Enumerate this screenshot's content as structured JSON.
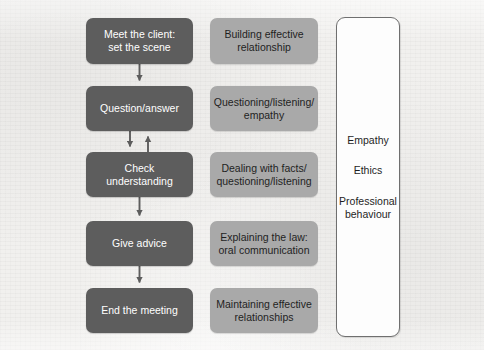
{
  "diagram": {
    "background_color": "#f1f0ee",
    "columns": {
      "process": {
        "name": "Interview stages",
        "box_color": "#5d5d5d",
        "text_color": "#ffffff",
        "steps": [
          {
            "id": "meet-the-client",
            "line1": "Meet the client:",
            "line2": "set the scene"
          },
          {
            "id": "question-answer",
            "line1": "Question/answer",
            "line2": ""
          },
          {
            "id": "check-understanding",
            "line1": "Check",
            "line2": "understanding"
          },
          {
            "id": "give-advice",
            "line1": "Give advice",
            "line2": ""
          },
          {
            "id": "end-the-meeting",
            "line1": "End the meeting",
            "line2": ""
          }
        ]
      },
      "skills": {
        "name": "Associated skills",
        "box_color": "#a9a9a9",
        "text_color": "#1f1f1f",
        "items": [
          {
            "id": "building-effective-relationship",
            "line1": "Building effective",
            "line2": "relationship"
          },
          {
            "id": "questioning-listening-empathy",
            "line1": "Questioning/listening/",
            "line2": "empathy"
          },
          {
            "id": "dealing-with-facts",
            "line1": "Dealing with facts/",
            "line2": "questioning/listening"
          },
          {
            "id": "explaining-the-law",
            "line1": "Explaining the law:",
            "line2": "oral communication"
          },
          {
            "id": "maintaining-effective-relationships",
            "line1": "Maintaining effective",
            "line2": "relationships"
          }
        ]
      },
      "values": {
        "name": "Overarching qualities",
        "box_color": "#fdfdfd",
        "border_color": "#6f6f6f",
        "text_color": "#1f1f1f",
        "items": [
          {
            "id": "empathy",
            "line1": "Empathy",
            "line2": ""
          },
          {
            "id": "ethics",
            "line1": "Ethics",
            "line2": ""
          },
          {
            "id": "professional-behaviour",
            "line1": "Professional",
            "line2": "behaviour"
          }
        ]
      }
    },
    "connectors": [
      {
        "id": "meet-to-question",
        "from": "meet-the-client",
        "to": "question-answer",
        "direction": "down"
      },
      {
        "id": "question-to-check",
        "from": "question-answer",
        "to": "check-understanding",
        "direction": "down"
      },
      {
        "id": "check-to-question",
        "from": "check-understanding",
        "to": "question-answer",
        "direction": "up"
      },
      {
        "id": "check-to-advice",
        "from": "check-understanding",
        "to": "give-advice",
        "direction": "down"
      },
      {
        "id": "advice-to-end",
        "from": "give-advice",
        "to": "end-the-meeting",
        "direction": "down"
      }
    ]
  }
}
